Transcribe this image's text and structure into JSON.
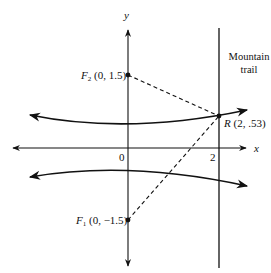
{
  "diagram": {
    "type": "hyperbola-foci-diagram",
    "axes": {
      "x_label": "x",
      "y_label": "y",
      "origin_label": "0",
      "x_tick_label": "2"
    },
    "foci": [
      {
        "name": "F",
        "subscript": "2",
        "coords": "(0, 1.5)",
        "x": 0,
        "y": 1.5
      },
      {
        "name": "F",
        "subscript": "1",
        "coords": "(0, −1.5)",
        "x": 0,
        "y": -1.5
      }
    ],
    "point_R": {
      "name": "R",
      "coords": "(2, .53)",
      "x": 2,
      "y": 0.53
    },
    "trail": {
      "line1": "Mountain",
      "line2": "trail",
      "x": 2
    },
    "colors": {
      "ink": "#111111",
      "background": "#ffffff"
    }
  }
}
